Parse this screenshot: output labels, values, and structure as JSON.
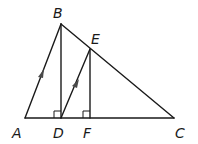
{
  "diagram": {
    "points": {
      "A": {
        "label": "A",
        "x": 25,
        "y": 118,
        "label_x": 12,
        "label_y": 138
      },
      "B": {
        "label": "B",
        "x": 61,
        "y": 24,
        "label_x": 53,
        "label_y": 18
      },
      "C": {
        "label": "C",
        "x": 174,
        "y": 118,
        "label_x": 175,
        "label_y": 138
      },
      "D": {
        "label": "D",
        "x": 61,
        "y": 118,
        "label_x": 53,
        "label_y": 138
      },
      "E": {
        "label": "E",
        "x": 90,
        "y": 49,
        "label_x": 91,
        "label_y": 44
      },
      "F": {
        "label": "F",
        "x": 90,
        "y": 118,
        "label_x": 83,
        "label_y": 138
      }
    },
    "segments": [
      "AC",
      "AB",
      "BC",
      "BD",
      "DE",
      "EF"
    ],
    "right_angles": [
      "BDA",
      "EFD"
    ],
    "parallel_marks": [
      "AB",
      "DE"
    ],
    "stroke_color": "#1a1a1a",
    "arrow_color": "#4a4a4a"
  }
}
